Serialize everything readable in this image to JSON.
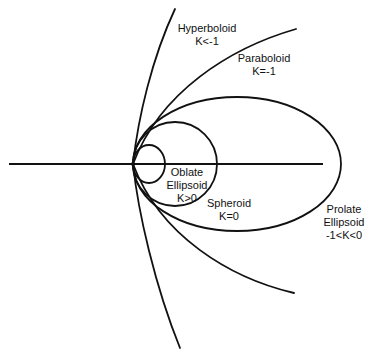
{
  "colors": {
    "stroke": "#111111",
    "background": "#ffffff"
  },
  "labels": {
    "hyperboloid": {
      "name": "Hyperboloid",
      "condition": "K<-1"
    },
    "paraboloid": {
      "name": "Paraboloid",
      "condition": "K=-1"
    },
    "oblate": {
      "name": "Oblate",
      "name2": "Ellipsoid",
      "condition": "K>0"
    },
    "spheroid": {
      "name": "Spheroid",
      "condition": "K=0"
    },
    "prolate": {
      "name": "Prolate",
      "name2": "Ellipsoid",
      "condition": "-1<K<0"
    }
  },
  "geometry": {
    "vertex": [
      133,
      164
    ],
    "axis": {
      "x1": 9,
      "x2": 323,
      "y": 164
    },
    "oblate_ellipse": {
      "cx": 149,
      "cy": 164,
      "rx": 16,
      "ry": 19
    },
    "sphere": {
      "cx": 175,
      "cy": 164,
      "r": 42
    },
    "prolate_ellipse": {
      "cx": 237,
      "cy": 164,
      "rx": 104,
      "ry": 67
    },
    "paraboloid_ends": [
      [
        296,
        29
      ],
      [
        294,
        293
      ]
    ],
    "hyperboloid_ends": [
      [
        175,
        9
      ],
      [
        180,
        348
      ]
    ]
  }
}
